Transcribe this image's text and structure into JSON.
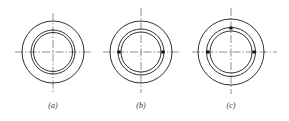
{
  "figure": {
    "stroke_color": "#1a1a1a",
    "centerline_color": "#444444",
    "panels": [
      {
        "id": "a",
        "label": "(a)",
        "center": [
          53,
          52
        ],
        "radii": {
          "outer": 31,
          "middle": 22,
          "inner": 19.5
        },
        "dots": []
      },
      {
        "id": "b",
        "label": "(b)",
        "center": [
          141,
          52
        ],
        "radii": {
          "outer": 31,
          "middle": 23,
          "inner": 20
        },
        "dots": [
          "left",
          "right"
        ]
      },
      {
        "id": "c",
        "label": "(c)",
        "center": [
          231,
          52
        ],
        "radii": {
          "outer": 34,
          "middle": 25,
          "inner": 21.5
        },
        "dots": [
          "left",
          "right",
          "top"
        ]
      }
    ]
  }
}
